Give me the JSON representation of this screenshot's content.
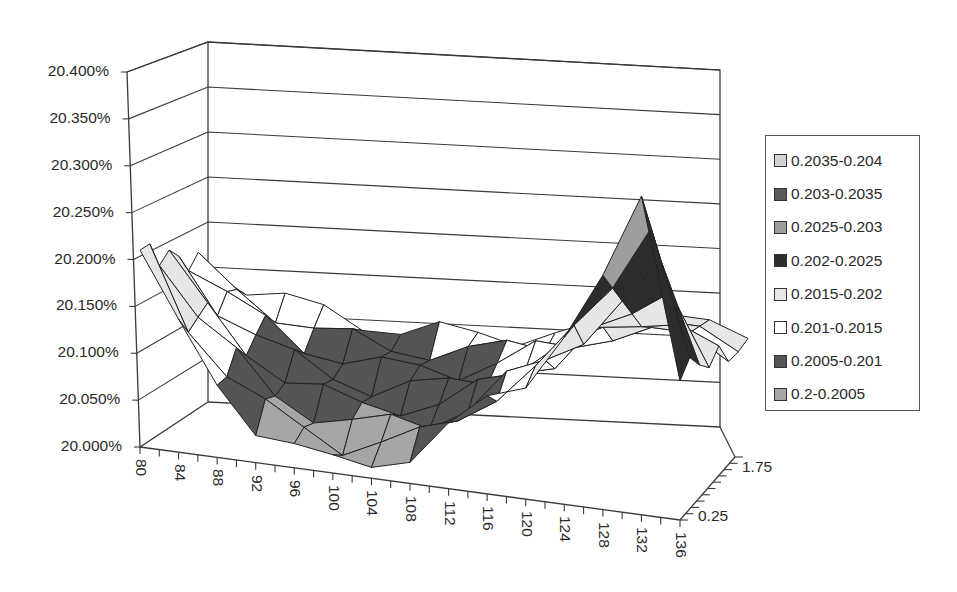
{
  "chart_data": {
    "type": "surface",
    "title": "",
    "xlabel": "",
    "ylabel": "",
    "zlabel": "",
    "y_axis": {
      "ticks": [
        "20.000%",
        "20.050%",
        "20.100%",
        "20.150%",
        "20.200%",
        "20.250%",
        "20.300%",
        "20.350%",
        "20.400%"
      ],
      "range": [
        0.2,
        0.204
      ]
    },
    "x_axis": {
      "ticks": [
        "80",
        "84",
        "88",
        "92",
        "96",
        "100",
        "104",
        "108",
        "112",
        "116",
        "120",
        "124",
        "128",
        "132",
        "136"
      ],
      "range": [
        80,
        136
      ]
    },
    "depth_axis": {
      "ticks": [
        "0.25",
        "1.75"
      ],
      "range": [
        0.25,
        2.0
      ]
    },
    "legend": {
      "position": "right",
      "entries": [
        {
          "label": "0.2035-0.204",
          "color": "#d2d2d2"
        },
        {
          "label": "0.203-0.2035",
          "color": "#5a5a5a"
        },
        {
          "label": "0.2025-0.203",
          "color": "#9e9e9e"
        },
        {
          "label": "0.202-0.2025",
          "color": "#2c2c2c"
        },
        {
          "label": "0.2015-0.202",
          "color": "#e6e6e6"
        },
        {
          "label": "0.201-0.2015",
          "color": "#ffffff"
        },
        {
          "label": "0.2005-0.201",
          "color": "#545454"
        },
        {
          "label": "0.2-0.2005",
          "color": "#a6a6a6"
        }
      ]
    },
    "surface_profile": {
      "description": "Volatility-smile-like surface: starts ~20.21% at strike 80, dips to ~20.00-20.05% near strikes 96-108, rises back to ~20.15% around 124-136, with a spike to ~20.34% at strike ~132 on the front (short maturity) edge.",
      "front_edge_strikes": [
        80,
        84,
        88,
        92,
        96,
        100,
        104,
        108,
        112,
        116,
        120,
        124,
        128,
        132,
        136
      ],
      "front_edge_values": [
        0.2021,
        0.2013,
        0.2008,
        0.2004,
        0.2002,
        0.2001,
        0.2002,
        0.2003,
        0.2006,
        0.201,
        0.2013,
        0.2018,
        0.2025,
        0.2034,
        0.2016
      ]
    },
    "grid": true
  }
}
